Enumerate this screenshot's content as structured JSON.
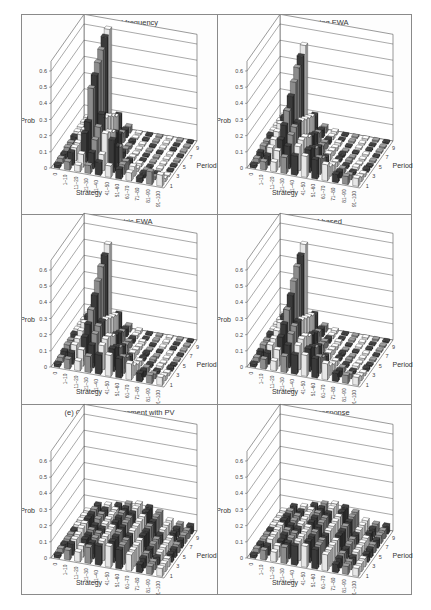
{
  "figure": {
    "panels": [
      {
        "id": "a",
        "title": "(a) Empirical frequency"
      },
      {
        "id": "b",
        "title": "(b) Self-tuning EWA"
      },
      {
        "id": "c",
        "title": "(c) Parametric EWA"
      },
      {
        "id": "d",
        "title": "(d) Belief-based"
      },
      {
        "id": "e",
        "title": "(e) Choice reinforcement with PV"
      },
      {
        "id": "f",
        "title": "(f) Quantal response"
      }
    ],
    "axes": {
      "ylabel": "Prob",
      "xlabel": "Strategy",
      "zlabel": "Period",
      "yticks": [
        "0",
        "0.1",
        "0.2",
        "0.3",
        "0.4",
        "0.5",
        "0.6"
      ],
      "xticks": [
        "0",
        "1–10",
        "11–20",
        "21–30",
        "31–40",
        "41–50",
        "51–60",
        "61–70",
        "71–80",
        "81–90",
        "91–100"
      ],
      "zticks": [
        "1",
        "3",
        "5",
        "7",
        "9"
      ]
    }
  },
  "chart_data": [
    {
      "type": "bar3d",
      "title": "(a) Empirical frequency",
      "xlabel": "Strategy",
      "ylabel": "Prob",
      "zlabel": "Period",
      "ylim": [
        0,
        0.6
      ],
      "categories": [
        "0",
        "1–10",
        "11–20",
        "21–30",
        "31–40",
        "41–50",
        "51–60",
        "61–70",
        "71–80",
        "81–90",
        "91–100"
      ],
      "periods": [
        1,
        2,
        3,
        4,
        5,
        6,
        7,
        8,
        9,
        10
      ],
      "values": [
        [
          0.02,
          0.05,
          0.04,
          0.05,
          0.08,
          0.07,
          0.06,
          0.05,
          0.03,
          0.08,
          0.07
        ],
        [
          0.03,
          0.08,
          0.08,
          0.1,
          0.1,
          0.2,
          0.06,
          0.06,
          0.03,
          0.02,
          0.02
        ],
        [
          0.03,
          0.08,
          0.18,
          0.15,
          0.2,
          0.13,
          0.05,
          0.02,
          0.02,
          0.01,
          0.01
        ],
        [
          0.04,
          0.08,
          0.22,
          0.2,
          0.18,
          0.1,
          0.03,
          0.02,
          0.01,
          0.01,
          0.01
        ],
        [
          0.04,
          0.1,
          0.4,
          0.25,
          0.15,
          0.04,
          0.02,
          0.01,
          0.01,
          0.01,
          0.01
        ],
        [
          0.05,
          0.1,
          0.45,
          0.2,
          0.12,
          0.03,
          0.01,
          0.01,
          0.01,
          0.01,
          0.01
        ],
        [
          0.05,
          0.12,
          0.5,
          0.18,
          0.08,
          0.02,
          0.01,
          0.01,
          0.01,
          0.01,
          0.01
        ],
        [
          0.05,
          0.12,
          0.55,
          0.15,
          0.06,
          0.02,
          0.01,
          0.01,
          0.01,
          0.01,
          0.01
        ],
        [
          0.05,
          0.12,
          0.6,
          0.12,
          0.05,
          0.01,
          0.01,
          0.01,
          0.01,
          0.01,
          0.01
        ],
        [
          0.05,
          0.12,
          0.62,
          0.1,
          0.04,
          0.01,
          0.01,
          0.01,
          0.01,
          0.01,
          0.01
        ]
      ]
    },
    {
      "type": "bar3d",
      "title": "(b) Self-tuning EWA",
      "xlabel": "Strategy",
      "ylabel": "Prob",
      "zlabel": "Period",
      "ylim": [
        0,
        0.6
      ],
      "categories": [
        "0",
        "1–10",
        "11–20",
        "21–30",
        "31–40",
        "41–50",
        "51–60",
        "61–70",
        "71–80",
        "81–90",
        "91–100"
      ],
      "periods": [
        1,
        2,
        3,
        4,
        5,
        6,
        7,
        8,
        9,
        10
      ],
      "values": [
        [
          0.02,
          0.05,
          0.06,
          0.1,
          0.12,
          0.13,
          0.12,
          0.1,
          0.05,
          0.05,
          0.05
        ],
        [
          0.03,
          0.06,
          0.1,
          0.14,
          0.15,
          0.14,
          0.1,
          0.06,
          0.04,
          0.03,
          0.03
        ],
        [
          0.04,
          0.08,
          0.14,
          0.18,
          0.16,
          0.12,
          0.07,
          0.04,
          0.03,
          0.02,
          0.02
        ],
        [
          0.05,
          0.1,
          0.2,
          0.2,
          0.15,
          0.09,
          0.05,
          0.03,
          0.02,
          0.02,
          0.02
        ],
        [
          0.05,
          0.12,
          0.26,
          0.2,
          0.12,
          0.07,
          0.04,
          0.02,
          0.02,
          0.01,
          0.01
        ],
        [
          0.06,
          0.14,
          0.32,
          0.18,
          0.1,
          0.05,
          0.03,
          0.02,
          0.01,
          0.01,
          0.01
        ],
        [
          0.06,
          0.15,
          0.38,
          0.16,
          0.08,
          0.04,
          0.02,
          0.01,
          0.01,
          0.01,
          0.01
        ],
        [
          0.06,
          0.16,
          0.44,
          0.14,
          0.06,
          0.03,
          0.02,
          0.01,
          0.01,
          0.01,
          0.01
        ],
        [
          0.06,
          0.16,
          0.48,
          0.12,
          0.05,
          0.02,
          0.01,
          0.01,
          0.01,
          0.01,
          0.01
        ],
        [
          0.06,
          0.16,
          0.52,
          0.1,
          0.04,
          0.02,
          0.01,
          0.01,
          0.01,
          0.01,
          0.01
        ]
      ]
    },
    {
      "type": "bar3d",
      "title": "(c) Parametric EWA",
      "xlabel": "Strategy",
      "ylabel": "Prob",
      "zlabel": "Period",
      "ylim": [
        0,
        0.6
      ],
      "categories": [
        "0",
        "1–10",
        "11–20",
        "21–30",
        "31–40",
        "41–50",
        "51–60",
        "61–70",
        "71–80",
        "81–90",
        "91–100"
      ],
      "periods": [
        1,
        2,
        3,
        4,
        5,
        6,
        7,
        8,
        9,
        10
      ],
      "values": [
        [
          0.02,
          0.06,
          0.06,
          0.1,
          0.12,
          0.13,
          0.12,
          0.1,
          0.05,
          0.05,
          0.05
        ],
        [
          0.03,
          0.07,
          0.1,
          0.14,
          0.15,
          0.14,
          0.1,
          0.06,
          0.04,
          0.03,
          0.03
        ],
        [
          0.04,
          0.09,
          0.15,
          0.18,
          0.16,
          0.12,
          0.07,
          0.04,
          0.03,
          0.02,
          0.02
        ],
        [
          0.05,
          0.1,
          0.2,
          0.2,
          0.15,
          0.09,
          0.05,
          0.03,
          0.02,
          0.02,
          0.02
        ],
        [
          0.05,
          0.12,
          0.26,
          0.2,
          0.12,
          0.07,
          0.04,
          0.02,
          0.02,
          0.01,
          0.01
        ],
        [
          0.06,
          0.14,
          0.32,
          0.18,
          0.1,
          0.05,
          0.03,
          0.02,
          0.01,
          0.01,
          0.01
        ],
        [
          0.06,
          0.15,
          0.38,
          0.16,
          0.08,
          0.04,
          0.02,
          0.01,
          0.01,
          0.01,
          0.01
        ],
        [
          0.06,
          0.16,
          0.44,
          0.14,
          0.06,
          0.03,
          0.02,
          0.01,
          0.01,
          0.01,
          0.01
        ],
        [
          0.06,
          0.16,
          0.48,
          0.12,
          0.05,
          0.02,
          0.01,
          0.01,
          0.01,
          0.01,
          0.01
        ],
        [
          0.06,
          0.16,
          0.52,
          0.1,
          0.04,
          0.02,
          0.01,
          0.01,
          0.01,
          0.01,
          0.01
        ]
      ]
    },
    {
      "type": "bar3d",
      "title": "(d) Belief-based",
      "xlabel": "Strategy",
      "ylabel": "Prob",
      "zlabel": "Period",
      "ylim": [
        0,
        0.6
      ],
      "categories": [
        "0",
        "1–10",
        "11–20",
        "21–30",
        "31–40",
        "41–50",
        "51–60",
        "61–70",
        "71–80",
        "81–90",
        "91–100"
      ],
      "periods": [
        1,
        2,
        3,
        4,
        5,
        6,
        7,
        8,
        9,
        10
      ],
      "values": [
        [
          0.02,
          0.06,
          0.06,
          0.1,
          0.12,
          0.13,
          0.12,
          0.1,
          0.05,
          0.05,
          0.05
        ],
        [
          0.03,
          0.07,
          0.1,
          0.14,
          0.15,
          0.14,
          0.1,
          0.06,
          0.04,
          0.03,
          0.03
        ],
        [
          0.04,
          0.09,
          0.15,
          0.18,
          0.16,
          0.12,
          0.07,
          0.04,
          0.03,
          0.02,
          0.02
        ],
        [
          0.05,
          0.1,
          0.2,
          0.2,
          0.15,
          0.09,
          0.05,
          0.03,
          0.02,
          0.02,
          0.02
        ],
        [
          0.05,
          0.12,
          0.26,
          0.2,
          0.12,
          0.07,
          0.04,
          0.02,
          0.02,
          0.01,
          0.01
        ],
        [
          0.06,
          0.14,
          0.32,
          0.18,
          0.1,
          0.05,
          0.03,
          0.02,
          0.01,
          0.01,
          0.01
        ],
        [
          0.06,
          0.15,
          0.38,
          0.16,
          0.08,
          0.04,
          0.02,
          0.01,
          0.01,
          0.01,
          0.01
        ],
        [
          0.06,
          0.16,
          0.44,
          0.14,
          0.06,
          0.03,
          0.02,
          0.01,
          0.01,
          0.01,
          0.01
        ],
        [
          0.06,
          0.16,
          0.48,
          0.12,
          0.05,
          0.02,
          0.01,
          0.01,
          0.01,
          0.01,
          0.01
        ],
        [
          0.06,
          0.16,
          0.52,
          0.1,
          0.04,
          0.02,
          0.01,
          0.01,
          0.01,
          0.01,
          0.01
        ]
      ]
    },
    {
      "type": "bar3d",
      "title": "(e) Choice reinforcement with PV",
      "xlabel": "Strategy",
      "ylabel": "Prob",
      "zlabel": "Period",
      "ylim": [
        0,
        0.6
      ],
      "categories": [
        "0",
        "1–10",
        "11–20",
        "21–30",
        "31–40",
        "41–50",
        "51–60",
        "61–70",
        "71–80",
        "81–90",
        "91–100"
      ],
      "periods": [
        1,
        2,
        3,
        4,
        5,
        6,
        7,
        8,
        9,
        10
      ],
      "values": [
        [
          0.02,
          0.06,
          0.06,
          0.1,
          0.12,
          0.13,
          0.12,
          0.1,
          0.05,
          0.05,
          0.05
        ],
        [
          0.03,
          0.07,
          0.07,
          0.1,
          0.12,
          0.13,
          0.12,
          0.1,
          0.06,
          0.05,
          0.05
        ],
        [
          0.03,
          0.07,
          0.08,
          0.1,
          0.12,
          0.13,
          0.12,
          0.1,
          0.06,
          0.05,
          0.05
        ],
        [
          0.03,
          0.07,
          0.08,
          0.1,
          0.12,
          0.13,
          0.12,
          0.1,
          0.06,
          0.05,
          0.05
        ],
        [
          0.03,
          0.08,
          0.08,
          0.1,
          0.12,
          0.13,
          0.12,
          0.1,
          0.06,
          0.05,
          0.05
        ],
        [
          0.03,
          0.08,
          0.08,
          0.1,
          0.12,
          0.13,
          0.12,
          0.1,
          0.06,
          0.05,
          0.05
        ],
        [
          0.03,
          0.08,
          0.09,
          0.1,
          0.12,
          0.13,
          0.12,
          0.1,
          0.06,
          0.05,
          0.05
        ],
        [
          0.03,
          0.08,
          0.09,
          0.1,
          0.12,
          0.13,
          0.12,
          0.1,
          0.06,
          0.05,
          0.05
        ],
        [
          0.03,
          0.08,
          0.09,
          0.1,
          0.12,
          0.13,
          0.12,
          0.1,
          0.06,
          0.05,
          0.05
        ],
        [
          0.03,
          0.08,
          0.09,
          0.1,
          0.12,
          0.13,
          0.12,
          0.1,
          0.06,
          0.05,
          0.05
        ]
      ]
    },
    {
      "type": "bar3d",
      "title": "(f) Quantal response",
      "xlabel": "Strategy",
      "ylabel": "Prob",
      "zlabel": "Period",
      "ylim": [
        0,
        0.6
      ],
      "categories": [
        "0",
        "1–10",
        "11–20",
        "21–30",
        "31–40",
        "41–50",
        "51–60",
        "61–70",
        "71–80",
        "81–90",
        "91–100"
      ],
      "periods": [
        1,
        2,
        3,
        4,
        5,
        6,
        7,
        8,
        9,
        10
      ],
      "values": [
        [
          0.02,
          0.06,
          0.06,
          0.1,
          0.12,
          0.13,
          0.12,
          0.1,
          0.05,
          0.05,
          0.05
        ],
        [
          0.03,
          0.06,
          0.07,
          0.1,
          0.12,
          0.13,
          0.12,
          0.1,
          0.06,
          0.05,
          0.05
        ],
        [
          0.03,
          0.07,
          0.07,
          0.1,
          0.12,
          0.13,
          0.12,
          0.1,
          0.06,
          0.05,
          0.05
        ],
        [
          0.03,
          0.07,
          0.08,
          0.1,
          0.12,
          0.13,
          0.12,
          0.1,
          0.06,
          0.05,
          0.05
        ],
        [
          0.03,
          0.07,
          0.08,
          0.1,
          0.12,
          0.13,
          0.12,
          0.1,
          0.06,
          0.05,
          0.05
        ],
        [
          0.03,
          0.07,
          0.08,
          0.1,
          0.12,
          0.13,
          0.12,
          0.1,
          0.06,
          0.05,
          0.05
        ],
        [
          0.03,
          0.07,
          0.08,
          0.1,
          0.12,
          0.13,
          0.12,
          0.1,
          0.06,
          0.05,
          0.05
        ],
        [
          0.03,
          0.07,
          0.08,
          0.1,
          0.12,
          0.13,
          0.12,
          0.1,
          0.06,
          0.05,
          0.05
        ],
        [
          0.03,
          0.07,
          0.08,
          0.1,
          0.12,
          0.13,
          0.12,
          0.1,
          0.06,
          0.05,
          0.05
        ],
        [
          0.03,
          0.07,
          0.08,
          0.1,
          0.12,
          0.13,
          0.12,
          0.1,
          0.06,
          0.05,
          0.05
        ]
      ]
    }
  ],
  "colors": {
    "frame": "#8a8a8a",
    "wall_line": "#555555",
    "bar_dark": "#3a3a3a",
    "bar_mid": "#8c8c8c",
    "bar_light": "#e6e6e6",
    "bar_edge": "#111111"
  }
}
